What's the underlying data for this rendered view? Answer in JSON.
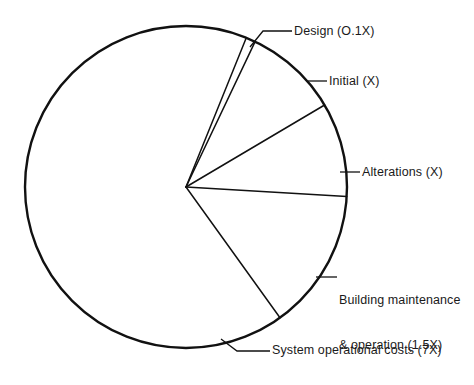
{
  "chart_data": {
    "type": "pie",
    "title": "",
    "subtitle": "",
    "xlabel": "",
    "ylabel": "",
    "legend_position": "none",
    "grid": false,
    "units": "X (multiples of initial cost)",
    "total": 10.6,
    "categories": [
      "Design (O.1X)",
      "Initial (X)",
      "Alterations (X)",
      "Building maintenance & operation (1.5X)",
      "System operational costs (7X)"
    ],
    "values": [
      0.1,
      1,
      1,
      1.5,
      7
    ],
    "slices": [
      {
        "key": "design",
        "label": "Design (O.1X)",
        "label_lines": [
          "Design (O.1X)"
        ],
        "value": 0.1,
        "value_text": "O.1X",
        "percent": 0.9,
        "start_angle": 22.0,
        "end_angle": 25.4,
        "fill": "#ffffff",
        "stroke": "#111111"
      },
      {
        "key": "initial",
        "label": "Initial (X)",
        "label_lines": [
          "Initial (X)"
        ],
        "value": 1,
        "value_text": "X",
        "percent": 9.4,
        "start_angle": 25.4,
        "end_angle": 59.4,
        "fill": "#ffffff",
        "stroke": "#111111"
      },
      {
        "key": "alterations",
        "label": "Alterations (X)",
        "label_lines": [
          "Alterations (X)"
        ],
        "value": 1,
        "value_text": "X",
        "percent": 9.4,
        "start_angle": 59.4,
        "end_angle": 93.4,
        "fill": "#ffffff",
        "stroke": "#111111"
      },
      {
        "key": "building",
        "label": "Building maintenance & operation (1.5X)",
        "label_lines": [
          "Building maintenance",
          "& operation (1.5X)"
        ],
        "value": 1.5,
        "value_text": "1.5X",
        "percent": 14.2,
        "start_angle": 93.4,
        "end_angle": 144.3,
        "fill": "#ffffff",
        "stroke": "#111111"
      },
      {
        "key": "system",
        "label": "System operational costs (7X)",
        "label_lines": [
          "System operational costs (7X)"
        ],
        "value": 7,
        "value_text": "7X",
        "percent": 66.0,
        "start_angle": 144.3,
        "end_angle": 382.0,
        "fill": "#ffffff",
        "stroke": "#111111"
      }
    ],
    "geometry": {
      "center_x": 186,
      "center_y": 187,
      "radius": 161
    },
    "colors": {
      "background": "#ffffff",
      "line": "#111111",
      "text": "#1a1a1a"
    }
  },
  "labels": {
    "design": "Design (O.1X)",
    "initial": "Initial (X)",
    "alterations": "Alterations (X)",
    "building_line1": "Building maintenance",
    "building_line2": "& operation (1.5X)",
    "system": "System operational costs (7X)"
  }
}
